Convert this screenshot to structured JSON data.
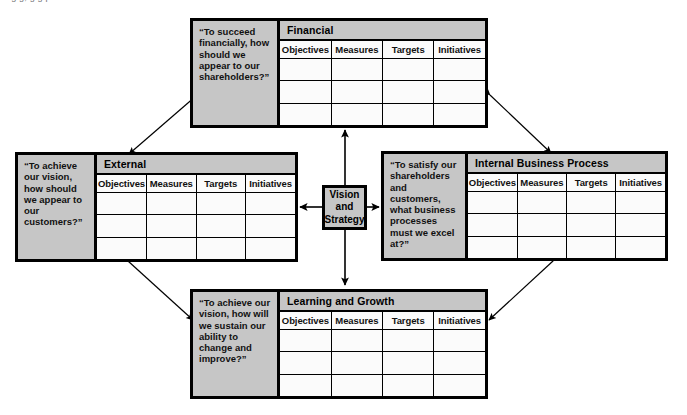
{
  "diagram": {
    "top_text_fragment": "ng   g,   g   g       p",
    "colors": {
      "panel_gray": "#c6c6c6",
      "cell_white": "#fbfbfb",
      "border_black": "#000000",
      "page_white": "#ffffff"
    },
    "column_headers": [
      "Objectives",
      "Measures",
      "Targets",
      "Initiatives"
    ],
    "data_row_count": 3,
    "center": {
      "name": "vision-and-strategy",
      "lines": [
        "Vision",
        "and",
        "Strategy"
      ],
      "label": "Vision and Strategy"
    },
    "perspectives": [
      {
        "id": "financial",
        "position": "top",
        "title": "Financial",
        "question": "“To succeed financially, how should we appear to our shareholders?”"
      },
      {
        "id": "external",
        "position": "left",
        "title": "External",
        "question": "“To achieve our vision, how should we appear to our customers?”"
      },
      {
        "id": "internal-business-process",
        "position": "right",
        "title": "Internal Business Process",
        "question": "“To satisfy our shareholders and customers, what business processes must we excel at?”"
      },
      {
        "id": "learning-and-growth",
        "position": "bottom",
        "title": "Learning and Growth",
        "question": "“To achieve our vision, how will we sustain our ability to change and improve?”"
      }
    ],
    "connectors": [
      {
        "id": "center-to-financial",
        "from": "vision-and-strategy",
        "to": "financial",
        "style": "double-headed-vertical"
      },
      {
        "id": "center-to-learning",
        "from": "vision-and-strategy",
        "to": "learning-and-growth",
        "style": "double-headed-vertical"
      },
      {
        "id": "center-to-external",
        "from": "vision-and-strategy",
        "to": "external",
        "style": "double-headed-horizontal"
      },
      {
        "id": "center-to-internal",
        "from": "vision-and-strategy",
        "to": "internal-business-process",
        "style": "double-headed-horizontal"
      },
      {
        "id": "financial-to-external",
        "from": "financial",
        "to": "external",
        "style": "double-headed-diagonal"
      },
      {
        "id": "financial-to-internal",
        "from": "financial",
        "to": "internal-business-process",
        "style": "double-headed-diagonal"
      },
      {
        "id": "external-to-learning",
        "from": "external",
        "to": "learning-and-growth",
        "style": "double-headed-diagonal"
      },
      {
        "id": "internal-to-learning",
        "from": "internal-business-process",
        "to": "learning-and-growth",
        "style": "double-headed-diagonal"
      }
    ]
  }
}
